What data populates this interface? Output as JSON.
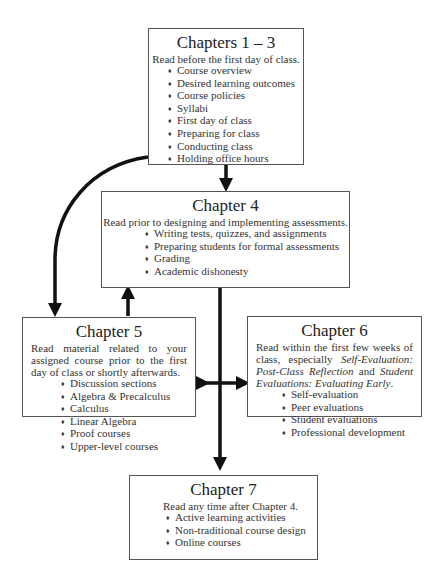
{
  "diagram": {
    "boxes": [
      {
        "id": "chapters-1-3",
        "title": "Chapters 1 – 3",
        "description": "Read before the first day of class.",
        "items": [
          "Course overview",
          "Desired learning outcomes",
          "Course policies",
          "Syllabi",
          "First day of class",
          "Preparing for class",
          "Conducting class",
          "Holding office hours"
        ]
      },
      {
        "id": "chapter-4",
        "title": "Chapter 4",
        "description": "Read prior to designing and implementing assessments.",
        "items": [
          "Writing tests, quizzes, and assignments",
          "Preparing students for formal assessments",
          "Grading",
          "Academic dishonesty"
        ]
      },
      {
        "id": "chapter-5",
        "title": "Chapter 5",
        "description": "Read material related to your assigned course prior to the first day of class or shortly afterwards.",
        "items": [
          "Discussion sections",
          "Algebra & Precalculus",
          "Calculus",
          "Linear Algebra",
          "Proof courses",
          "Upper-level courses"
        ]
      },
      {
        "id": "chapter-6",
        "title": "Chapter 6",
        "description_parts": {
          "p1": "Read within the first few weeks of class, especially ",
          "em1": "Self-Evaluation: Post-Class Reflection",
          "p2": " and ",
          "em2": "Student Evaluations: Evaluating Early",
          "p3": "."
        },
        "items": [
          "Self-evaluation",
          "Peer evaluations",
          "Student evaluations",
          "Professional development"
        ]
      },
      {
        "id": "chapter-7",
        "title": "Chapter 7",
        "description": "Read any time after Chapter 4.",
        "items": [
          "Active learning activities",
          "Non-traditional course design",
          "Online courses"
        ]
      }
    ],
    "bullet": "♦",
    "arrows": [
      {
        "from": "chapters-1-3",
        "to": "chapter-4",
        "type": "single"
      },
      {
        "from": "chapters-1-3",
        "to": "chapter-5",
        "type": "single-curved"
      },
      {
        "from": "chapter-5",
        "to": "chapter-4",
        "type": "single"
      },
      {
        "from": "chapter-4",
        "to": "chapter-7",
        "type": "single"
      },
      {
        "from": "chapter-5",
        "to": "chapter-6",
        "type": "double"
      }
    ]
  }
}
